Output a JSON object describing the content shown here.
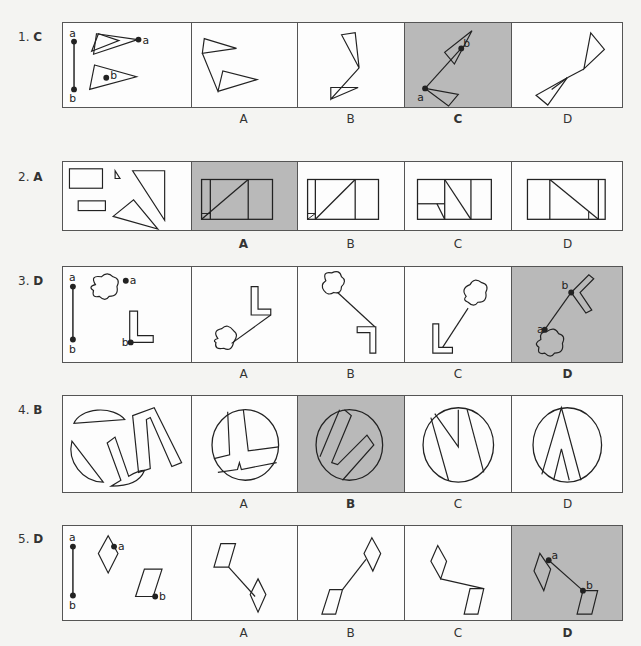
{
  "header": {
    "title": ""
  },
  "questions": [
    {
      "number": "1.",
      "answer": "C",
      "options": [
        "A",
        "B",
        "C",
        "D"
      ],
      "selected_index": 2
    },
    {
      "number": "2.",
      "answer": "A",
      "options": [
        "A",
        "B",
        "C",
        "D"
      ],
      "selected_index": 0
    },
    {
      "number": "3.",
      "answer": "D",
      "options": [
        "A",
        "B",
        "C",
        "D"
      ],
      "selected_index": 3
    },
    {
      "number": "4.",
      "answer": "B",
      "options": [
        "A",
        "B",
        "C",
        "D"
      ],
      "selected_index": 1
    },
    {
      "number": "5.",
      "answer": "D",
      "options": [
        "A",
        "B",
        "C",
        "D"
      ],
      "selected_index": 3
    }
  ],
  "point_labels": {
    "a": "a",
    "b": "b"
  },
  "colors": {
    "shaded_cell": "#b9b9b9",
    "line": "#222222",
    "border": "#555555",
    "background": "#f4f4f2"
  }
}
